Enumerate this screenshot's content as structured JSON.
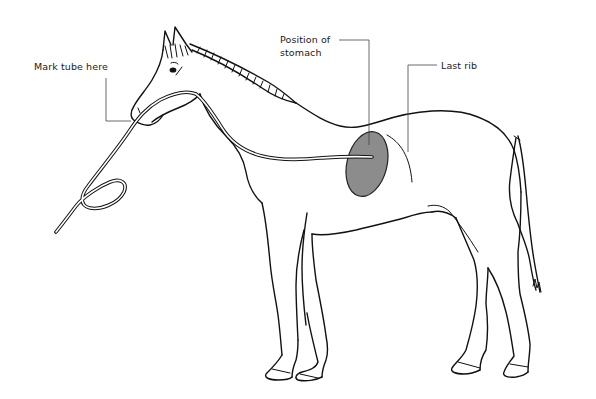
{
  "diagram": {
    "labels": {
      "mark_tube": "Mark tube here",
      "stomach_line1": "Position of",
      "stomach_line2": "stomach",
      "last_rib": "Last rib"
    },
    "colors": {
      "outline": "#111111",
      "stomach_fill": "#8c8c8c",
      "leader": "#444444",
      "background": "#ffffff"
    }
  }
}
